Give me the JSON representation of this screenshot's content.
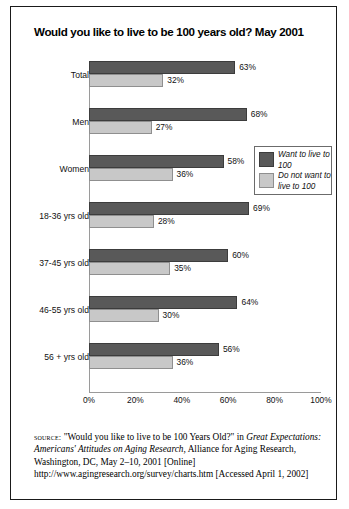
{
  "title": "Would you like to live to be 100 years old? May 2001",
  "legend": {
    "items": [
      {
        "label": "Want to live to 100",
        "color": "#595959"
      },
      {
        "label": "Do not want to live to 100",
        "color": "#c8c8c8"
      }
    ]
  },
  "axis": {
    "ticks": [
      "0%",
      "20%",
      "40%",
      "60%",
      "80%",
      "100%"
    ]
  },
  "source": {
    "label": "source:",
    "line1_quote": "\"Would you like to live to be 100 Years Old?\"",
    "line1_in": "in",
    "title_italic": "Great Expectations: Americans' Attitudes on Aging Research,",
    "publisher": "Alliance for Aging Research, Washington, DC, May 2–10, 2001",
    "online": "[Online] http://www.agingresearch.org/survey/charts.htm [Accessed April 1, 2002]"
  },
  "chart_data": {
    "type": "bar",
    "orientation": "horizontal",
    "title": "Would you like to live to be 100 years old? May 2001",
    "xlabel": "",
    "ylabel": "",
    "xlim": [
      0,
      100
    ],
    "xticks": [
      0,
      20,
      40,
      60,
      80,
      100
    ],
    "xtick_labels": [
      "0%",
      "20%",
      "40%",
      "60%",
      "80%",
      "100%"
    ],
    "grid": false,
    "legend_position": "inside-right",
    "categories": [
      "Total",
      "Men",
      "Women",
      "18-36 yrs old",
      "37-45 yrs old",
      "46-55 yrs old",
      "56 + yrs old"
    ],
    "series": [
      {
        "name": "Want to live to 100",
        "color": "#595959",
        "values": [
          63,
          68,
          58,
          69,
          60,
          64,
          56
        ],
        "labels": [
          "63%",
          "68%",
          "58%",
          "69%",
          "60%",
          "64%",
          "56%"
        ]
      },
      {
        "name": "Do not want to live to 100",
        "color": "#c8c8c8",
        "values": [
          32,
          27,
          36,
          28,
          35,
          30,
          36
        ],
        "labels": [
          "32%",
          "27%",
          "36%",
          "28%",
          "35%",
          "30%",
          "36%"
        ]
      }
    ]
  }
}
